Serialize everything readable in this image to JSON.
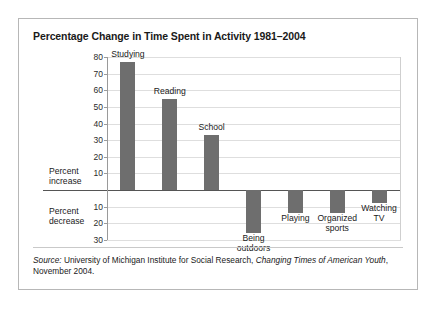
{
  "figure": {
    "title": "Percentage Change in Time Spent in Activity 1981–2004",
    "axis_captions": {
      "increase": "Percent\nincrease",
      "decrease": "Percent\ndecrease"
    },
    "source": {
      "label": "Source:",
      "text_before_italic": " University of Michigan Institute for Social Research, ",
      "italic_title": "Changing Times of American Youth",
      "text_after_italic": ", November 2004."
    }
  },
  "chart_data": {
    "type": "bar",
    "title": "Percentage Change in Time Spent in Activity 1981–2004",
    "xlabel": "",
    "ylabel": "Percent increase / Percent decrease",
    "ylim": [
      -30,
      80
    ],
    "grid": true,
    "legend": "none",
    "yticks_positive": [
      "80",
      "70",
      "60",
      "50",
      "40",
      "30",
      "20",
      "10"
    ],
    "yticks_negative": [
      "10",
      "20",
      "30"
    ],
    "categories": [
      "Studying",
      "Reading",
      "School",
      "Being\noutdoors",
      "Playing",
      "Organized\nsports",
      "Watching\nTV"
    ],
    "values": [
      77,
      55,
      33,
      -26,
      -14,
      -14,
      -8
    ]
  }
}
